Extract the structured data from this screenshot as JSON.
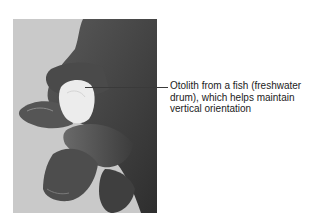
{
  "figure": {
    "photo_subject": "hand holding fish otolith",
    "callout": {
      "label": "Otolith from a fish (freshwater drum), which helps maintain vertical orientation"
    },
    "colors": {
      "background": "#ffffff",
      "photo_background": "#c9c9c9",
      "skin_dark": "#3a3a3a",
      "otolith": "#ececec",
      "leader_line": "#3a3a3a",
      "text": "#222222"
    }
  }
}
